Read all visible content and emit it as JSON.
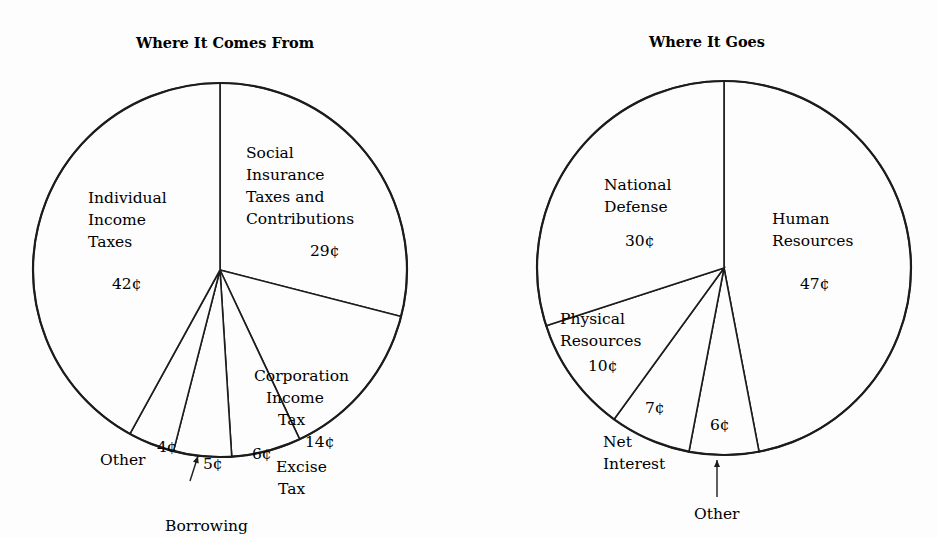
{
  "chart_data": [
    {
      "type": "pie",
      "title": "Where It Comes From",
      "unit": "¢",
      "center": [
        220,
        270
      ],
      "radius": 187,
      "slices": [
        {
          "name": "Social Insurance Taxes and Contributions",
          "label_lines": [
            "Social",
            "Insurance",
            "Taxes and",
            "Contributions"
          ],
          "value": 29,
          "value_label": "29¢"
        },
        {
          "name": "Corporation Income Tax",
          "label_lines": [
            "Corporation",
            "Income",
            "Tax"
          ],
          "value": 14,
          "value_label": "14¢"
        },
        {
          "name": "Excise Tax",
          "label_lines": [
            "Excise",
            "Tax"
          ],
          "value": 6,
          "value_label": "6¢"
        },
        {
          "name": "Borrowing",
          "label_lines": [
            "Borrowing"
          ],
          "value": 5,
          "value_label": "5¢"
        },
        {
          "name": "Other",
          "label_lines": [
            "Other"
          ],
          "value": 4,
          "value_label": "4¢"
        },
        {
          "name": "Individual Income Taxes",
          "label_lines": [
            "Individual",
            "Income",
            "Taxes"
          ],
          "value": 42,
          "value_label": "42¢"
        }
      ]
    },
    {
      "type": "pie",
      "title": "Where It Goes",
      "unit": "¢",
      "center": [
        724,
        268
      ],
      "radius": 187,
      "slices": [
        {
          "name": "Human Resources",
          "label_lines": [
            "Human",
            "Resources"
          ],
          "value": 47,
          "value_label": "47¢"
        },
        {
          "name": "Other",
          "label_lines": [
            "Other"
          ],
          "value": 6,
          "value_label": "6¢"
        },
        {
          "name": "Net Interest",
          "label_lines": [
            "Net",
            "Interest"
          ],
          "value": 7,
          "value_label": "7¢"
        },
        {
          "name": "Physical Resources",
          "label_lines": [
            "Physical",
            "Resources"
          ],
          "value": 10,
          "value_label": "10¢"
        },
        {
          "name": "National Defense",
          "label_lines": [
            "National",
            "Defense"
          ],
          "value": 30,
          "value_label": "30¢"
        }
      ]
    }
  ],
  "layout": {
    "left": {
      "title_pos": [
        225,
        48
      ],
      "labels": [
        {
          "lines_pos": [
            [
              246,
              158
            ],
            [
              246,
              180
            ],
            [
              246,
              202
            ],
            [
              246,
              224
            ]
          ],
          "value_pos": [
            310,
            256
          ]
        },
        {
          "lines_pos": [
            [
              254,
              381
            ],
            [
              266,
              403
            ],
            [
              278,
              425
            ]
          ],
          "value_pos": [
            305,
            447
          ]
        },
        {
          "lines_pos": [
            [
              276,
              472
            ],
            [
              278,
              494
            ]
          ],
          "value_pos": [
            252,
            459
          ]
        },
        {
          "lines_pos": [
            [
              165,
              531
            ]
          ],
          "value_pos": [
            203,
            469
          ]
        },
        {
          "lines_pos": [
            [
              100,
              465
            ]
          ],
          "value_pos": [
            157,
            452
          ]
        },
        {
          "lines_pos": [
            [
              88,
              203
            ],
            [
              88,
              225
            ],
            [
              88,
              247
            ]
          ],
          "value_pos": [
            112,
            289
          ]
        }
      ],
      "borrowing_arrow": {
        "from": [
          190,
          481
        ],
        "to": [
          198,
          456
        ]
      }
    },
    "right": {
      "title_pos": [
        707,
        47
      ],
      "labels": [
        {
          "lines_pos": [
            [
              772,
              224
            ],
            [
              772,
              246
            ]
          ],
          "value_pos": [
            800,
            289
          ]
        },
        {
          "lines_pos": [
            [
              694,
              519
            ]
          ],
          "value_pos": [
            710,
            430
          ]
        },
        {
          "lines_pos": [
            [
              603,
              447
            ],
            [
              603,
              469
            ]
          ],
          "value_pos": [
            645,
            413
          ]
        },
        {
          "lines_pos": [
            [
              560,
              324
            ],
            [
              560,
              346
            ]
          ],
          "value_pos": [
            588,
            371
          ]
        },
        {
          "lines_pos": [
            [
              604,
              190
            ],
            [
              604,
              212
            ]
          ],
          "value_pos": [
            625,
            246
          ]
        }
      ],
      "other_arrow": {
        "from": [
          717,
          497
        ],
        "to": [
          717,
          460
        ]
      }
    }
  }
}
